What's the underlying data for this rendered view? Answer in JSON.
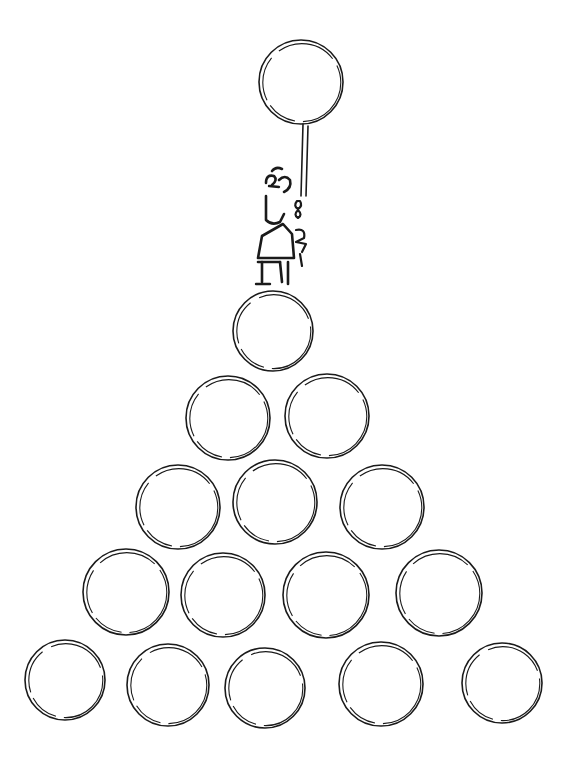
{
  "illustration": {
    "description": "Line drawing of a stick figure standing atop a triangular pyramid of coins, holding a balloon on a string",
    "ink_color": "#1a1a1a",
    "background_color": "#ffffff",
    "balloon": {
      "cx": 301,
      "cy": 82,
      "r": 42
    },
    "figure": {
      "x": 255,
      "y": 165,
      "stands_on_row": 1
    },
    "coin_rows": [
      {
        "row": 1,
        "count": 1,
        "coins": [
          {
            "cx": 273,
            "cy": 331,
            "r": 40
          }
        ]
      },
      {
        "row": 2,
        "count": 2,
        "coins": [
          {
            "cx": 228,
            "cy": 418,
            "r": 42
          },
          {
            "cx": 327,
            "cy": 416,
            "r": 42
          }
        ]
      },
      {
        "row": 3,
        "count": 3,
        "coins": [
          {
            "cx": 178,
            "cy": 507,
            "r": 42
          },
          {
            "cx": 275,
            "cy": 502,
            "r": 42
          },
          {
            "cx": 382,
            "cy": 507,
            "r": 42
          }
        ]
      },
      {
        "row": 4,
        "count": 4,
        "coins": [
          {
            "cx": 126,
            "cy": 592,
            "r": 43
          },
          {
            "cx": 223,
            "cy": 595,
            "r": 42
          },
          {
            "cx": 326,
            "cy": 595,
            "r": 43
          },
          {
            "cx": 439,
            "cy": 593,
            "r": 43
          }
        ]
      },
      {
        "row": 5,
        "count": 5,
        "coins": [
          {
            "cx": 65,
            "cy": 680,
            "r": 40
          },
          {
            "cx": 168,
            "cy": 685,
            "r": 41
          },
          {
            "cx": 265,
            "cy": 688,
            "r": 40
          },
          {
            "cx": 381,
            "cy": 684,
            "r": 42
          },
          {
            "cx": 502,
            "cy": 683,
            "r": 40
          }
        ]
      }
    ],
    "total_coins": 15
  }
}
